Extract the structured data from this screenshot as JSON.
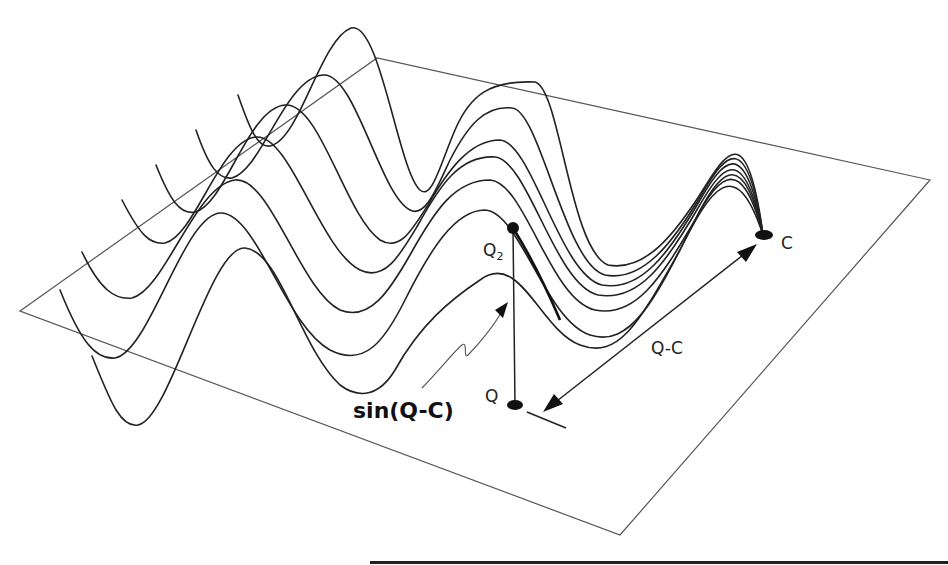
{
  "diagram": {
    "labels": {
      "q2_main": "Q",
      "q2_sub": "2",
      "q": "Q",
      "c": "C",
      "distance": "Q-C",
      "formula": "sin(Q-C)"
    },
    "points": {
      "Q2": [
        513,
        228
      ],
      "Q": [
        515,
        405
      ],
      "C": [
        763,
        235
      ]
    },
    "plane_corners": [
      [
        20,
        311
      ],
      [
        377,
        58
      ],
      [
        930,
        180
      ],
      [
        620,
        535
      ]
    ],
    "wave_count": 7,
    "colors": {
      "line": "#222222",
      "plane": "#555555",
      "background": "#ffffff"
    }
  }
}
